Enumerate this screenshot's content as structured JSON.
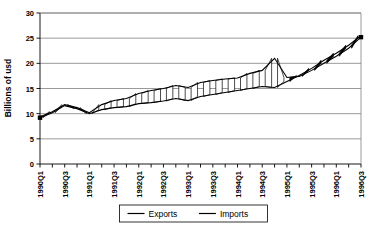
{
  "chart_data": {
    "type": "line",
    "title": "",
    "xlabel": "",
    "ylabel": "Billions of usd",
    "ylim": [
      0,
      30
    ],
    "ytick_step": 5,
    "yticks": [
      0,
      5,
      10,
      15,
      20,
      25,
      30
    ],
    "grid": true,
    "legend_position": "bottom",
    "x": [
      "1990Q1",
      "1990Q2",
      "1990Q3",
      "1990Q4",
      "1991Q1",
      "1991Q2",
      "1991Q3",
      "1991Q4",
      "1992Q1",
      "1992Q2",
      "1992Q3",
      "1992Q4",
      "1993Q1",
      "1993Q2",
      "1993Q3",
      "1993Q4",
      "1994Q1",
      "1994Q2",
      "1994Q3",
      "1994Q4",
      "1995Q1",
      "1995Q2",
      "1995Q3",
      "1995Q4",
      "1996Q1",
      "1996Q2",
      "1996Q3"
    ],
    "xtick_labels": [
      "1990Q1",
      "",
      "1990Q3",
      "",
      "1991Q1",
      "",
      "1991Q3",
      "",
      "1992Q1",
      "",
      "1992Q3",
      "",
      "1993Q1",
      "",
      "1993Q3",
      "",
      "1994Q1",
      "",
      "1994Q3",
      "",
      "1995Q1",
      "",
      "1995Q3",
      "",
      "1996Q1",
      "",
      "1996Q3"
    ],
    "series": [
      {
        "name": "Exports",
        "values": [
          9.2,
          10.2,
          11.6,
          11.0,
          10.0,
          10.8,
          11.2,
          11.4,
          12.0,
          12.2,
          12.5,
          13.0,
          12.6,
          13.4,
          13.8,
          14.2,
          14.6,
          15.0,
          15.4,
          15.2,
          16.4,
          17.6,
          19.0,
          20.6,
          22.0,
          23.6,
          25.5
        ]
      },
      {
        "name": "Imports",
        "values": [
          9.4,
          10.4,
          11.8,
          11.2,
          10.2,
          11.8,
          12.6,
          13.0,
          14.0,
          14.6,
          15.0,
          15.6,
          15.2,
          16.2,
          16.6,
          16.9,
          17.1,
          18.0,
          18.6,
          21.0,
          17.2,
          17.4,
          18.6,
          20.0,
          21.4,
          23.0,
          25.2
        ]
      }
    ]
  },
  "legend": {
    "items": [
      {
        "label": "Exports"
      },
      {
        "label": "Imports"
      }
    ]
  },
  "colors": {
    "line": "#000000",
    "grid": "#808080",
    "background": "#ffffff"
  }
}
